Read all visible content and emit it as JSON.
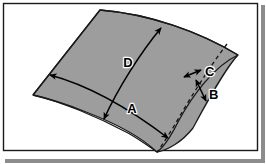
{
  "figure": {
    "border": {
      "stroke_color": "#1a1a1a",
      "fill_color": "#ffffff",
      "stroke_width": 1.4,
      "shadow_color": "#8c8c8c"
    },
    "shape": {
      "name": "saddle-shaped curved panel",
      "fill_color": "#9d9d9d",
      "stroke_color": "#1a1a1a",
      "stroke_width": 1.3,
      "outline_path": "M 33 95 L 100 10 C 150 14 200 32 238 55 C 224 70 206 104 193 128 C 182 142 168 150 157 152 C 140 136 112 122 86 112 C 66 104 46 98 33 95 Z",
      "fold_path": "M 238 55 C 214 66 192 96 178 122 C 171 136 164 147 157 152",
      "dashed_path": "M 227 44 C 213 62 194 92 181 114 C 172 130 163 144 157 152"
    },
    "dimensions": [
      {
        "id": "A",
        "label": "A",
        "label_x": 132,
        "label_y": 113,
        "arrow_type": "double",
        "path": "M 50 75 C 80 83 118 100 168 138",
        "description": "width across the panel, left tip to bottom right"
      },
      {
        "id": "B",
        "label": "B",
        "label_x": 209,
        "label_y": 99,
        "arrow_type": "double",
        "path": "M 196 80 L 206 101",
        "description": "short edge thickness at lower right"
      },
      {
        "id": "C",
        "label": "C",
        "label_x": 205,
        "label_y": 76,
        "arrow_type": "double",
        "path": "M 184 77 L 201 70",
        "description": "offset between dashed fold line and right edge"
      },
      {
        "id": "D",
        "label": "D",
        "label_x": 128,
        "label_y": 67,
        "arrow_type": "double",
        "path": "M 161 28 C 141 52 118 88 104 119",
        "description": "length along the panel, top right to bottom left"
      }
    ]
  }
}
